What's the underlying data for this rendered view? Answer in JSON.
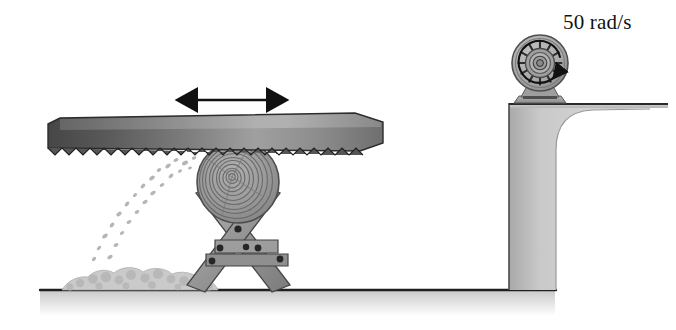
{
  "figure": {
    "background_color": "#ffffff"
  },
  "annotations": {
    "angular_velocity_label": "50 rad/s"
  },
  "colors": {
    "ink": "#1a1a1a",
    "blade_dark": "#4a4a4a",
    "blade_light": "#b9b9b9",
    "wood_gray": "#9a9a9a",
    "wood_dark": "#6e6e6e",
    "wall_gray": "#c2c2c2",
    "wall_edge": "#8f8f8f",
    "motor_gray": "#adadad",
    "motor_dark": "#6a6a6a",
    "ground_shadow": "#d6d6d6",
    "sawdust": "#cfcfcf",
    "bolt": "#2b2b2b"
  },
  "parts": {
    "saw_blade": {
      "name": "saw-blade",
      "motion_arrow": "double-headed-horizontal-arrow",
      "teeth_count": 44
    },
    "log": {
      "name": "log-end-grain",
      "ring_count": 11
    },
    "sawhorse": {
      "name": "sawhorse-x-frame",
      "bolt_count": 6,
      "crossbar_count": 2
    },
    "motor": {
      "name": "motor-pulley",
      "spoke_count": 12,
      "rotation_direction": "counterclockwise",
      "hub_rings": 4
    },
    "wall": {
      "name": "step-wall",
      "corner": "rounded-inner-corner"
    },
    "sawdust_pile": {
      "name": "sawdust-pile"
    },
    "sawdust_spray": {
      "name": "sawdust-spray",
      "direction": "down-left"
    },
    "ground": {
      "name": "ground-line"
    }
  }
}
